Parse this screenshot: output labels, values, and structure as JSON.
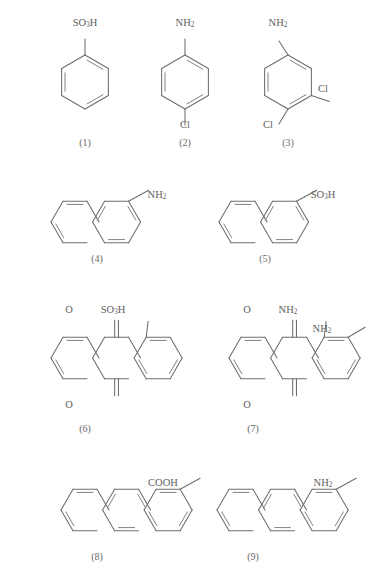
{
  "page": {
    "background_color": "#ffffff",
    "bond_color": "#6d6d6d",
    "label_color": "#5e5e5e",
    "width": 367,
    "height": 585
  },
  "compounds": [
    {
      "number": "(1)",
      "name": "benzenesulfonic-acid",
      "core": "benzene",
      "label_x": 85,
      "label_y": 146,
      "substituents": [
        {
          "text": "SO",
          "sub": "3",
          "tail": "H",
          "x": 85,
          "y": 24
        }
      ]
    },
    {
      "number": "(2)",
      "name": "4-chloroaniline",
      "core": "benzene",
      "label_x": 185,
      "label_y": 146,
      "substituents": [
        {
          "text": "NH",
          "sub": "2",
          "tail": "",
          "x": 185,
          "y": 24
        },
        {
          "text": "Cl",
          "sub": "",
          "tail": "",
          "x": 185,
          "y": 126
        }
      ]
    },
    {
      "number": "(3)",
      "name": "3,4-dichloroaniline",
      "core": "benzene",
      "label_x": 288,
      "label_y": 146,
      "substituents": [
        {
          "text": "NH",
          "sub": "2",
          "tail": "",
          "x": 278,
          "y": 24
        },
        {
          "text": "Cl",
          "sub": "",
          "tail": "",
          "x": 323,
          "y": 90
        },
        {
          "text": "Cl",
          "sub": "",
          "tail": "",
          "x": 268,
          "y": 126
        }
      ]
    },
    {
      "number": "(4)",
      "name": "2-naphthylamine",
      "core": "naphthalene",
      "label_x": 97,
      "label_y": 262,
      "substituents": [
        {
          "text": "NH",
          "sub": "2",
          "tail": "",
          "x": 157,
          "y": 196
        }
      ]
    },
    {
      "number": "(5)",
      "name": "naphthalene-2-sulfonic-acid",
      "core": "naphthalene",
      "label_x": 265,
      "label_y": 262,
      "substituents": [
        {
          "text": "SO",
          "sub": "3",
          "tail": "H",
          "x": 323,
          "y": 196
        }
      ]
    },
    {
      "number": "(6)",
      "name": "anthraquinone-1-sulfonic-acid",
      "core": "anthraquinone",
      "label_x": 85,
      "label_y": 432,
      "substituents": [
        {
          "text": "O",
          "sub": "",
          "tail": "",
          "x": 69,
          "y": 311
        },
        {
          "text": "O",
          "sub": "",
          "tail": "",
          "x": 69,
          "y": 406
        },
        {
          "text": "SO",
          "sub": "3",
          "tail": "H",
          "x": 113,
          "y": 311
        }
      ]
    },
    {
      "number": "(7)",
      "name": "1,2-diaminoanthraquinone",
      "core": "anthraquinone",
      "label_x": 253,
      "label_y": 432,
      "substituents": [
        {
          "text": "O",
          "sub": "",
          "tail": "",
          "x": 247,
          "y": 311
        },
        {
          "text": "O",
          "sub": "",
          "tail": "",
          "x": 247,
          "y": 406
        },
        {
          "text": "NH",
          "sub": "2",
          "tail": "",
          "x": 288,
          "y": 311
        },
        {
          "text": "NH",
          "sub": "2",
          "tail": "",
          "x": 322,
          "y": 330
        }
      ]
    },
    {
      "number": "(8)",
      "name": "anthracene-2-carboxylic-acid",
      "core": "anthracene",
      "label_x": 97,
      "label_y": 560,
      "substituents": [
        {
          "text": "COOH",
          "sub": "",
          "tail": "",
          "x": 163,
          "y": 484
        }
      ]
    },
    {
      "number": "(9)",
      "name": "2-aminoanthracene",
      "core": "anthracene",
      "label_x": 253,
      "label_y": 560,
      "substituents": [
        {
          "text": "NH",
          "sub": "2",
          "tail": "",
          "x": 323,
          "y": 484
        }
      ]
    }
  ],
  "geometry": {
    "benzene": [
      {
        "origin_x": 85,
        "origin_y": 82,
        "r": 27
      },
      {
        "origin_x": 185,
        "origin_y": 82,
        "r": 27
      },
      {
        "origin_x": 288,
        "origin_y": 82,
        "r": 27
      }
    ],
    "naphthalene": [
      {
        "origin_x": 75,
        "origin_y": 222,
        "r": 24
      },
      {
        "origin_x": 243,
        "origin_y": 222,
        "r": 24
      }
    ],
    "anthraquinone": [
      {
        "origin_x": 75,
        "origin_y": 358,
        "r": 24
      },
      {
        "origin_x": 253,
        "origin_y": 358,
        "r": 24
      }
    ],
    "anthracene": [
      {
        "origin_x": 85,
        "origin_y": 510,
        "r": 24
      },
      {
        "origin_x": 241,
        "origin_y": 510,
        "r": 24
      }
    ]
  }
}
